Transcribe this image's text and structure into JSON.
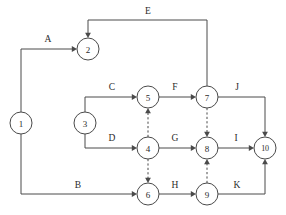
{
  "diagram": {
    "type": "directed-graph",
    "canvas": {
      "width": 286,
      "height": 215
    },
    "style": {
      "line_color": "#4a4a4a",
      "text_color": "#2b2b2b",
      "background": "#ffffff",
      "node_fill": "#ffffff",
      "node_radius": 11
    },
    "nodes": [
      {
        "id": "1",
        "label": "1",
        "x": 21,
        "y": 123
      },
      {
        "id": "2",
        "label": "2",
        "x": 88,
        "y": 49
      },
      {
        "id": "3",
        "label": "3",
        "x": 85,
        "y": 123
      },
      {
        "id": "4",
        "label": "4",
        "x": 148,
        "y": 148
      },
      {
        "id": "5",
        "label": "5",
        "x": 148,
        "y": 97
      },
      {
        "id": "6",
        "label": "6",
        "x": 148,
        "y": 194
      },
      {
        "id": "7",
        "label": "7",
        "x": 207,
        "y": 97
      },
      {
        "id": "8",
        "label": "8",
        "x": 207,
        "y": 148
      },
      {
        "id": "9",
        "label": "9",
        "x": 207,
        "y": 194
      },
      {
        "id": "10",
        "label": "10",
        "x": 265,
        "y": 148
      }
    ],
    "edges": [
      {
        "id": "edge-A",
        "label": "A",
        "from": "1",
        "to": "2",
        "dashed": false,
        "label_x": 48,
        "label_y": 42,
        "points": "21,112 21,49 73,49",
        "arrow": {
          "x": 77,
          "y": 49,
          "dir": "right"
        }
      },
      {
        "id": "edge-B",
        "label": "B",
        "from": "1",
        "to": "6",
        "dashed": false,
        "label_x": 78,
        "label_y": 188,
        "points": "21,134 21,194 133,194",
        "arrow": {
          "x": 137,
          "y": 194,
          "dir": "right"
        }
      },
      {
        "id": "edge-C",
        "label": "C",
        "from": "3",
        "to": "5",
        "dashed": false,
        "label_x": 112,
        "label_y": 90,
        "points": "85,112 85,97 133,97",
        "arrow": {
          "x": 137,
          "y": 97,
          "dir": "right"
        }
      },
      {
        "id": "edge-D",
        "label": "D",
        "from": "3",
        "to": "4",
        "dashed": false,
        "label_x": 112,
        "label_y": 141,
        "points": "85,134 85,148 133,148",
        "arrow": {
          "x": 137,
          "y": 148,
          "dir": "right"
        }
      },
      {
        "id": "edge-E",
        "label": "E",
        "from": "7",
        "to": "2",
        "dashed": false,
        "label_x": 148,
        "label_y": 14,
        "points": "207,86 207,20 88,20 88,34",
        "arrow": {
          "x": 88,
          "y": 38,
          "dir": "down"
        }
      },
      {
        "id": "edge-F",
        "label": "F",
        "from": "5",
        "to": "7",
        "dashed": false,
        "label_x": 175,
        "label_y": 90,
        "points": "159,97 192,97",
        "arrow": {
          "x": 196,
          "y": 97,
          "dir": "right"
        }
      },
      {
        "id": "edge-G",
        "label": "G",
        "from": "4",
        "to": "8",
        "dashed": false,
        "label_x": 175,
        "label_y": 141,
        "points": "159,148 192,148",
        "arrow": {
          "x": 196,
          "y": 148,
          "dir": "right"
        }
      },
      {
        "id": "edge-H",
        "label": "H",
        "from": "6",
        "to": "9",
        "dashed": false,
        "label_x": 175,
        "label_y": 188,
        "points": "159,194 192,194",
        "arrow": {
          "x": 196,
          "y": 194,
          "dir": "right"
        }
      },
      {
        "id": "edge-I",
        "label": "I",
        "from": "8",
        "to": "10",
        "dashed": false,
        "label_x": 236,
        "label_y": 141,
        "points": "218,148 250,148",
        "arrow": {
          "x": 254,
          "y": 148,
          "dir": "right"
        }
      },
      {
        "id": "edge-J",
        "label": "J",
        "from": "7",
        "to": "10",
        "dashed": false,
        "label_x": 237,
        "label_y": 90,
        "points": "218,97 265,97 265,133",
        "arrow": {
          "x": 265,
          "y": 137,
          "dir": "down"
        }
      },
      {
        "id": "edge-K",
        "label": "K",
        "from": "9",
        "to": "10",
        "dashed": false,
        "label_x": 237,
        "label_y": 188,
        "points": "218,194 265,194 265,163",
        "arrow": {
          "x": 265,
          "y": 159,
          "dir": "up"
        }
      },
      {
        "id": "edge-dummy-4-5",
        "label": "",
        "from": "4",
        "to": "5",
        "dashed": true,
        "label_x": 0,
        "label_y": 0,
        "points": "148,137 148,112",
        "arrow": {
          "x": 148,
          "y": 108,
          "dir": "up"
        }
      },
      {
        "id": "edge-dummy-4-6",
        "label": "",
        "from": "4",
        "to": "6",
        "dashed": true,
        "label_x": 0,
        "label_y": 0,
        "points": "148,159 148,179",
        "arrow": {
          "x": 148,
          "y": 183,
          "dir": "down"
        }
      },
      {
        "id": "edge-dummy-7-8",
        "label": "",
        "from": "7",
        "to": "8",
        "dashed": true,
        "label_x": 0,
        "label_y": 0,
        "points": "207,108 207,133",
        "arrow": {
          "x": 207,
          "y": 137,
          "dir": "down"
        }
      },
      {
        "id": "edge-dummy-9-8",
        "label": "",
        "from": "9",
        "to": "8",
        "dashed": true,
        "label_x": 0,
        "label_y": 0,
        "points": "207,183 207,163",
        "arrow": {
          "x": 207,
          "y": 159,
          "dir": "up"
        }
      }
    ]
  }
}
